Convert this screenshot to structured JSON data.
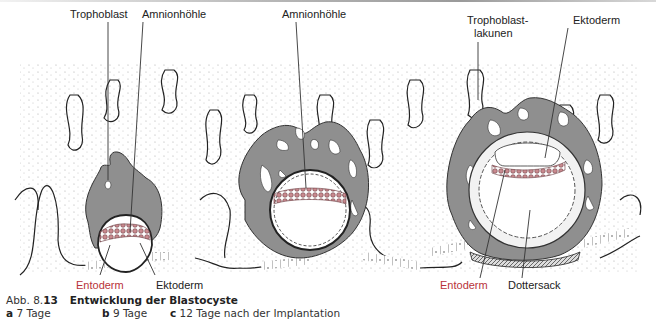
{
  "figure": {
    "labels": {
      "a_trophoblast": "Trophoblast",
      "a_amnionhoehle": "Amnionhöhle",
      "a_entoderm": "Entoderm",
      "a_ektoderm": "Ektoderm",
      "b_amnionhoehle": "Amnionhöhle",
      "c_trophoblastlakunen_1": "Trophoblast-",
      "c_trophoblastlakunen_2": "lakunen",
      "c_ektoderm": "Ektoderm",
      "c_entoderm": "Entoderm",
      "c_dottersack": "Dottersack"
    },
    "colors": {
      "trophoblast": "#8f8f8f",
      "entoderm_label": "#b8323a",
      "embryo_cells": "#c98a8f"
    }
  },
  "caption": {
    "prefix": "Abb. 8.",
    "number": "13",
    "title": "Entwicklung der Blastocyste",
    "panels": [
      {
        "letter": "a",
        "text": "7 Tage"
      },
      {
        "letter": "b",
        "text": "9 Tage"
      },
      {
        "letter": "c",
        "text": "12 Tage nach der Implantation"
      }
    ]
  }
}
